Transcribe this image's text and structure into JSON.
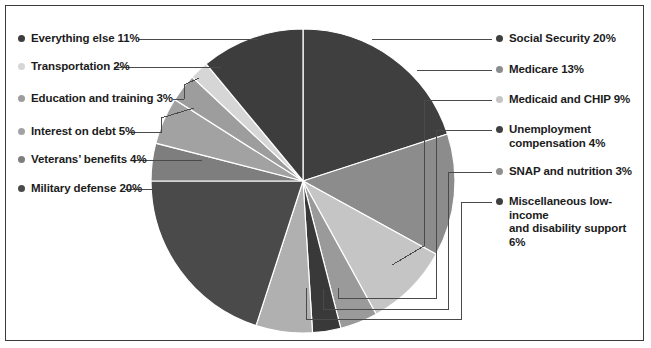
{
  "figure": {
    "background_color": "#ffffff",
    "border_color": "#3b3b3b"
  },
  "chart_data": {
    "type": "pie",
    "title": "",
    "subtitle": "",
    "xlabel": "",
    "ylabel": "",
    "legend_position": "outside-both-sides",
    "grid": false,
    "start_angle_deg": 0,
    "direction": "clockwise",
    "total_percent": 100,
    "categories": [
      "Social Security",
      "Medicare",
      "Medicaid and CHIP",
      "Unemployment compensation",
      "SNAP and nutrition",
      "Miscellaneous low-income and disability support",
      "Military defense",
      "Veterans' benefits",
      "Interest on debt",
      "Education and training",
      "Transportation",
      "Everything else"
    ],
    "values": [
      20,
      13,
      9,
      4,
      3,
      6,
      20,
      4,
      5,
      3,
      2,
      11
    ],
    "colors": [
      "#3f3f3f",
      "#8c8c8c",
      "#c5c5c5",
      "#9a9a9a",
      "#393939",
      "#b0b0b0",
      "#4a4a4a",
      "#7e7e7e",
      "#a2a2a2",
      "#9d9d9d",
      "#d6d6d6",
      "#3d3d3d"
    ]
  },
  "labels": {
    "left": [
      {
        "text": "Everything else 11%",
        "color": "#3d3d3d"
      },
      {
        "text": "Transportation 2%",
        "color": "#d6d6d6"
      },
      {
        "text": "Education and training 3%",
        "color": "#9d9d9d"
      },
      {
        "text": "Interest on debt 5%",
        "color": "#a2a2a2"
      },
      {
        "text": "Veterans’ benefits 4%",
        "color": "#7e7e7e"
      },
      {
        "text": "Military defense 20%",
        "color": "#4a4a4a"
      }
    ],
    "right": [
      {
        "text": "Social Security 20%",
        "color": "#3f3f3f"
      },
      {
        "text": "Medicare 13%",
        "color": "#8c8c8c"
      },
      {
        "text": "Medicaid and CHIP 9%",
        "color": "#c5c5c5"
      },
      {
        "text": "Unemployment\ncompensation 4%",
        "color": "#3f3f3f"
      },
      {
        "text": "SNAP and nutrition 3%",
        "color": "#8f8f8f"
      },
      {
        "text": "Miscellaneous low-income\nand disability support 6%",
        "color": "#3f3f3f"
      }
    ]
  }
}
